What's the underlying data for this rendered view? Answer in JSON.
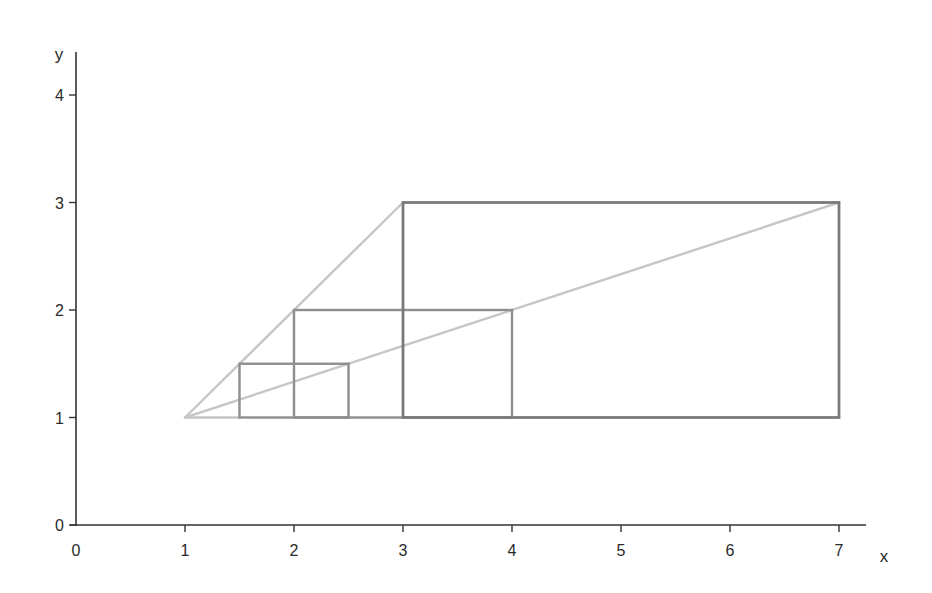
{
  "chart_data": {
    "type": "line",
    "title": "",
    "xlabel": "x",
    "ylabel": "y",
    "xlim": [
      0,
      7
    ],
    "ylim": [
      0,
      4
    ],
    "x_ticks": [
      "0",
      "1",
      "2",
      "3",
      "4",
      "5",
      "6",
      "7"
    ],
    "y_ticks": [
      "0",
      "1",
      "2",
      "3",
      "4"
    ],
    "grid": false,
    "legend": null,
    "rectangles": [
      {
        "name": "small",
        "x0": 1.5,
        "y0": 1,
        "x1": 2.5,
        "y1": 1.5,
        "color": "#8e8e8e"
      },
      {
        "name": "medium",
        "x0": 2,
        "y0": 1,
        "x1": 4,
        "y1": 2,
        "color": "#8e8e8e"
      },
      {
        "name": "large",
        "x0": 3,
        "y0": 1,
        "x1": 7,
        "y1": 3,
        "color": "#7a7a7a"
      }
    ],
    "lines": [
      {
        "name": "upper-ray",
        "points": [
          [
            1,
            1
          ],
          [
            3,
            3
          ]
        ],
        "color": "#c6c6c6"
      },
      {
        "name": "diagonal-ray",
        "points": [
          [
            1,
            1
          ],
          [
            7,
            3
          ]
        ],
        "color": "#c6c6c6"
      },
      {
        "name": "base-segment",
        "points": [
          [
            1,
            1
          ],
          [
            1.5,
            1
          ]
        ],
        "color": "#c6c6c6"
      }
    ],
    "apex": [
      1,
      1
    ]
  },
  "layout": {
    "x_origin_px": 76,
    "x_unit_px": 109,
    "y_origin_px": 525,
    "y_unit_px": 107.5,
    "x_axis_end_px": 866,
    "y_axis_top_px": 52,
    "axis_color": "#333333"
  }
}
